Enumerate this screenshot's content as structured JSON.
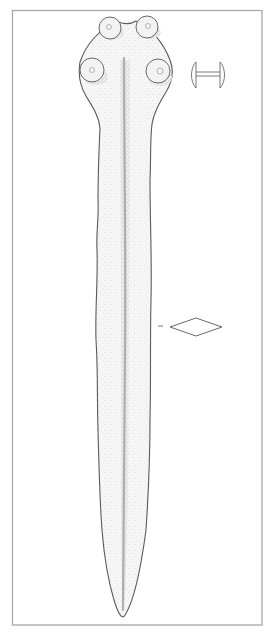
{
  "figure": {
    "views": [
      "plan view",
      "rivet side profile",
      "blade cross-section"
    ],
    "rivet_count": 4,
    "cross_section_shape": "lozenge",
    "colors": {
      "ink": "#5a5a5a",
      "frame": "#a8a8a8",
      "stipple": "#8c8c8c",
      "background": "#ffffff"
    }
  }
}
